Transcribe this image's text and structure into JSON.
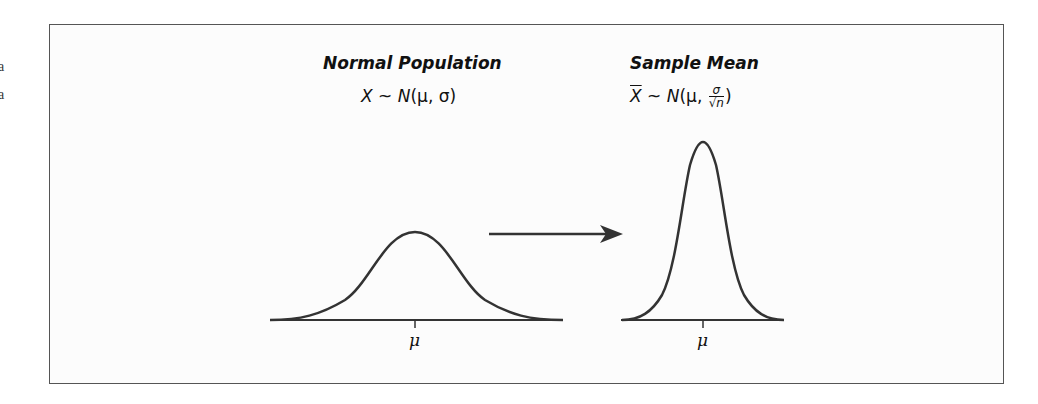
{
  "edge_fragments": [
    "a",
    "a"
  ],
  "left_panel": {
    "title": "Normal Population",
    "formula": {
      "lhs": "X",
      "tilde": "~",
      "dist": "N",
      "args": "(μ, σ)"
    },
    "axis_label": "μ"
  },
  "right_panel": {
    "title": "Sample Mean",
    "formula": {
      "lhs": "X",
      "tilde": "~",
      "dist": "N",
      "open": "(μ, ",
      "num": "σ",
      "den": "√n",
      "close": ")"
    },
    "axis_label": "μ"
  },
  "colors": {
    "curve": "#333333",
    "frame": "#555555",
    "background": "#fcfcfc"
  }
}
